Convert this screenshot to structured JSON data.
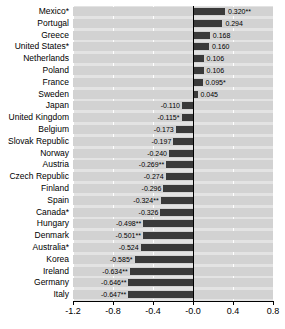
{
  "chart_data": {
    "type": "bar",
    "orientation": "horizontal",
    "title": "",
    "subtitle": "",
    "xlabel": "",
    "ylabel": "",
    "xlim": [
      -1.2,
      0.8
    ],
    "xticks": [
      "-1.2",
      "-0.8",
      "-0.4",
      "-0.0",
      "0.4",
      "0.8"
    ],
    "xtick_values": [
      -1.2,
      -0.8,
      -0.4,
      0.0,
      0.4,
      0.8
    ],
    "grid": true,
    "legend": "none",
    "categories": [
      "Mexico*",
      "Portugal",
      "Greece",
      "United States*",
      "Netherlands",
      "Poland",
      "France",
      "Sweden",
      "Japan",
      "United Kingdom",
      "Belgium",
      "Slovak Republic",
      "Norway",
      "Austria",
      "Czech Republic",
      "Finland",
      "Spain",
      "Canada*",
      "Hungary",
      "Denmark",
      "Australia*",
      "Korea",
      "Ireland",
      "Germany",
      "Italy"
    ],
    "values": [
      0.32,
      0.294,
      0.168,
      0.16,
      0.106,
      0.106,
      0.095,
      0.045,
      -0.11,
      -0.115,
      -0.173,
      -0.197,
      -0.24,
      -0.269,
      -0.274,
      -0.296,
      -0.324,
      -0.326,
      -0.498,
      -0.501,
      -0.524,
      -0.585,
      -0.634,
      -0.646,
      -0.647
    ],
    "value_labels": [
      "0.320**",
      "0.294",
      "0.168",
      "0.160",
      "0.106",
      "0.106",
      "0.095*",
      "0.045",
      "-0.110",
      "-0.115*",
      "-0.173",
      "-0.197",
      "-0.240",
      "-0.269**",
      "-0.274",
      "-0.296",
      "-0.324**",
      "-0.326",
      "-0.498**",
      "-0.501**",
      "-0.524",
      "-0.585*",
      "-0.634**",
      "-0.646**",
      "-0.647**"
    ]
  },
  "colors": {
    "bar": "#3a3a3a",
    "band": "#d2d2d2",
    "plot_background": "#e3e3e3",
    "gridline": "#ffffff",
    "axis": "#000000"
  }
}
